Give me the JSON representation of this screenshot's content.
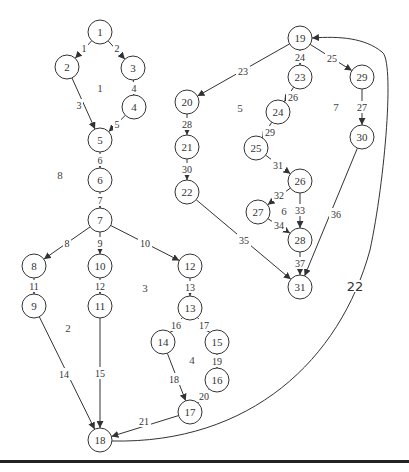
{
  "diagram": {
    "type": "control-flow-graph",
    "colors": {
      "stroke": "#333333",
      "background": "#ffffff"
    },
    "node_radius": 12,
    "nodes": [
      {
        "id": "1",
        "x": 100,
        "y": 32
      },
      {
        "id": "2",
        "x": 67,
        "y": 67
      },
      {
        "id": "3",
        "x": 133,
        "y": 68
      },
      {
        "id": "4",
        "x": 134,
        "y": 107
      },
      {
        "id": "5",
        "x": 100,
        "y": 140
      },
      {
        "id": "6",
        "x": 100,
        "y": 180
      },
      {
        "id": "7",
        "x": 100,
        "y": 220
      },
      {
        "id": "8",
        "x": 34,
        "y": 266
      },
      {
        "id": "9",
        "x": 34,
        "y": 306
      },
      {
        "id": "10",
        "x": 100,
        "y": 266
      },
      {
        "id": "11",
        "x": 100,
        "y": 306
      },
      {
        "id": "12",
        "x": 190,
        "y": 266
      },
      {
        "id": "13",
        "x": 190,
        "y": 308
      },
      {
        "id": "14",
        "x": 163,
        "y": 342
      },
      {
        "id": "15",
        "x": 217,
        "y": 342
      },
      {
        "id": "16",
        "x": 217,
        "y": 380
      },
      {
        "id": "17",
        "x": 190,
        "y": 412
      },
      {
        "id": "18",
        "x": 100,
        "y": 440
      },
      {
        "id": "19",
        "x": 300,
        "y": 38
      },
      {
        "id": "20",
        "x": 187,
        "y": 102
      },
      {
        "id": "21",
        "x": 187,
        "y": 147
      },
      {
        "id": "22",
        "x": 187,
        "y": 192
      },
      {
        "id": "23",
        "x": 300,
        "y": 77
      },
      {
        "id": "24",
        "x": 278,
        "y": 112
      },
      {
        "id": "25",
        "x": 256,
        "y": 148
      },
      {
        "id": "26",
        "x": 300,
        "y": 181
      },
      {
        "id": "27",
        "x": 258,
        "y": 212
      },
      {
        "id": "28",
        "x": 300,
        "y": 240
      },
      {
        "id": "29",
        "x": 362,
        "y": 77
      },
      {
        "id": "30",
        "x": 362,
        "y": 137
      },
      {
        "id": "31",
        "x": 300,
        "y": 287
      }
    ],
    "edges": [
      {
        "label": "1",
        "from": "1",
        "to": "2",
        "lx": 84,
        "ly": 48
      },
      {
        "label": "2",
        "from": "1",
        "to": "3",
        "lx": 117,
        "ly": 48
      },
      {
        "label": "3",
        "from": "2",
        "to": "5",
        "lx": 79,
        "ly": 105
      },
      {
        "label": "4",
        "from": "3",
        "to": "4",
        "lx": 134,
        "ly": 88
      },
      {
        "label": "5",
        "from": "4",
        "to": "5",
        "lx": 117,
        "ly": 124
      },
      {
        "label": "6",
        "from": "5",
        "to": "6",
        "lx": 100,
        "ly": 160
      },
      {
        "label": "7",
        "from": "6",
        "to": "7",
        "lx": 100,
        "ly": 200
      },
      {
        "label": "8",
        "from": "7",
        "to": "8",
        "lx": 67,
        "ly": 243
      },
      {
        "label": "9",
        "from": "7",
        "to": "10",
        "lx": 100,
        "ly": 243
      },
      {
        "label": "10",
        "from": "7",
        "to": "12",
        "lx": 145,
        "ly": 243
      },
      {
        "label": "11",
        "from": "8",
        "to": "9",
        "lx": 34,
        "ly": 286
      },
      {
        "label": "12",
        "from": "10",
        "to": "11",
        "lx": 100,
        "ly": 286
      },
      {
        "label": "13",
        "from": "12",
        "to": "13",
        "lx": 190,
        "ly": 287
      },
      {
        "label": "14",
        "from": "9",
        "to": "18",
        "lx": 64,
        "ly": 374
      },
      {
        "label": "15",
        "from": "11",
        "to": "18",
        "lx": 100,
        "ly": 373
      },
      {
        "label": "16",
        "from": "13",
        "to": "14",
        "lx": 176,
        "ly": 325
      },
      {
        "label": "17",
        "from": "13",
        "to": "15",
        "lx": 204,
        "ly": 325
      },
      {
        "label": "18",
        "from": "14",
        "to": "17",
        "lx": 174,
        "ly": 379
      },
      {
        "label": "19",
        "from": "15",
        "to": "16",
        "lx": 217,
        "ly": 361
      },
      {
        "label": "20",
        "from": "16",
        "to": "17",
        "lx": 204,
        "ly": 396
      },
      {
        "label": "21",
        "from": "17",
        "to": "18",
        "lx": 144,
        "ly": 421
      },
      {
        "label": "22",
        "from": "18",
        "to": "19",
        "lx": 355,
        "ly": 286,
        "curved": true,
        "large": true
      },
      {
        "label": "23",
        "from": "19",
        "to": "20",
        "lx": 243,
        "ly": 71
      },
      {
        "label": "24",
        "from": "19",
        "to": "23",
        "lx": 300,
        "ly": 57
      },
      {
        "label": "25",
        "from": "19",
        "to": "29",
        "lx": 332,
        "ly": 58
      },
      {
        "label": "26",
        "from": "23",
        "to": "24",
        "lx": 293,
        "ly": 97
      },
      {
        "label": "27",
        "from": "29",
        "to": "30",
        "lx": 362,
        "ly": 107
      },
      {
        "label": "28",
        "from": "20",
        "to": "21",
        "lx": 187,
        "ly": 124
      },
      {
        "label": "29",
        "from": "24",
        "to": "25",
        "lx": 270,
        "ly": 132
      },
      {
        "label": "30",
        "from": "21",
        "to": "22",
        "lx": 187,
        "ly": 169
      },
      {
        "label": "31",
        "from": "25",
        "to": "26",
        "lx": 278,
        "ly": 165
      },
      {
        "label": "32",
        "from": "26",
        "to": "27",
        "lx": 279,
        "ly": 195
      },
      {
        "label": "33",
        "from": "26",
        "to": "28",
        "lx": 300,
        "ly": 210
      },
      {
        "label": "34",
        "from": "27",
        "to": "28",
        "lx": 279,
        "ly": 225
      },
      {
        "label": "35",
        "from": "22",
        "to": "31",
        "lx": 244,
        "ly": 240
      },
      {
        "label": "36",
        "from": "30",
        "to": "31",
        "lx": 336,
        "ly": 214
      },
      {
        "label": "37",
        "from": "28",
        "to": "31",
        "lx": 300,
        "ly": 263
      }
    ],
    "regions": [
      {
        "label": "1",
        "x": 100,
        "y": 88
      },
      {
        "label": "2",
        "x": 68,
        "y": 328
      },
      {
        "label": "3",
        "x": 145,
        "y": 288
      },
      {
        "label": "4",
        "x": 192,
        "y": 360
      },
      {
        "label": "5",
        "x": 240,
        "y": 108
      },
      {
        "label": "6",
        "x": 284,
        "y": 211
      },
      {
        "label": "7",
        "x": 336,
        "y": 107
      },
      {
        "label": "8",
        "x": 60,
        "y": 175
      }
    ]
  },
  "footer": {
    "cutoff_text_visible": true
  }
}
